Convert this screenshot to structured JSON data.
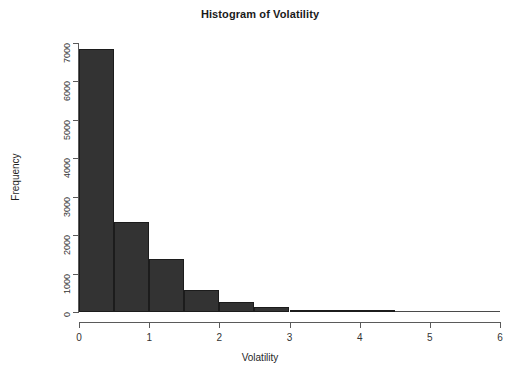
{
  "chart_data": {
    "type": "bar",
    "title": "Histogram of Volatility",
    "xlabel": "Volatility",
    "ylabel": "Frequency",
    "xlim": [
      0,
      6
    ],
    "ylim": [
      0,
      7000
    ],
    "grid": false,
    "legend": null,
    "bin_width": 0.5,
    "bin_edges": [
      0,
      0.5,
      1.0,
      1.5,
      2.0,
      2.5,
      3.0,
      3.5,
      4.0,
      4.5,
      5.0,
      5.5,
      6.0
    ],
    "categories": [
      "0-0.5",
      "0.5-1",
      "1-1.5",
      "1.5-2",
      "2-2.5",
      "2.5-3",
      "3-3.5",
      "3.5-4",
      "4-4.5",
      "4.5-5",
      "5-5.5",
      "5.5-6"
    ],
    "values": [
      6850,
      2340,
      1390,
      570,
      250,
      120,
      60,
      20,
      5,
      0,
      0,
      0
    ],
    "bar_color": "#333333",
    "bar_border_color": "#1c1c1c",
    "axis_color": "#5a5a5a",
    "background": "#ffffff",
    "xticks": [
      0,
      1,
      2,
      3,
      4,
      5,
      6
    ],
    "xtick_labels": [
      "0",
      "1",
      "2",
      "3",
      "4",
      "5",
      "6"
    ],
    "yticks": [
      0,
      1000,
      2000,
      3000,
      4000,
      5000,
      6000,
      7000
    ],
    "ytick_labels": [
      "0",
      "1000",
      "2000",
      "3000",
      "4000",
      "5000",
      "6000",
      "7000"
    ]
  }
}
